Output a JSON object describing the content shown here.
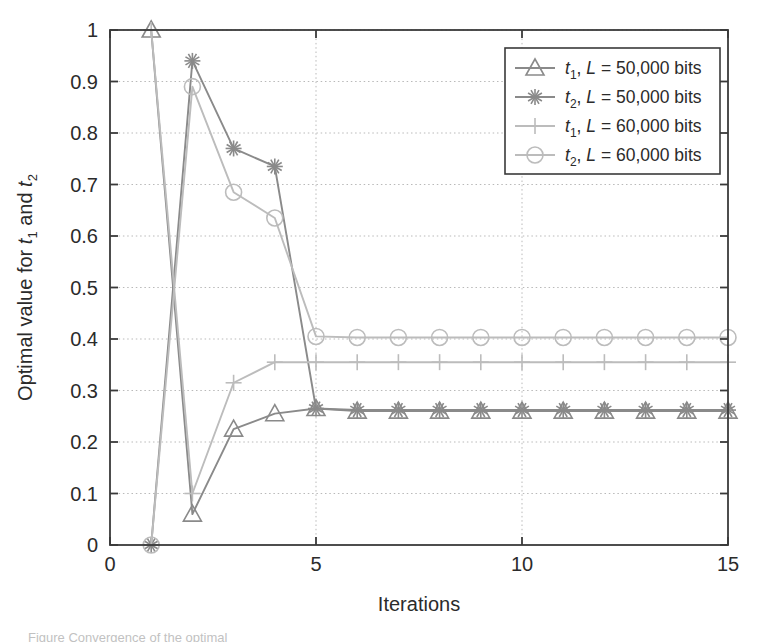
{
  "figure": {
    "caption_partial": "Figure  Convergence of the optimal",
    "background_color": "#ffffff"
  },
  "chart_data": {
    "type": "line",
    "title": "",
    "xlabel": "Iterations",
    "ylabel": "Optimal value for t1 and t2",
    "ylabel_rich": {
      "prefix": "Optimal value for ",
      "var1": "t",
      "var1_sub": "1",
      "middle": " and ",
      "var2": "t",
      "var2_sub": "2"
    },
    "xlim": [
      0,
      15
    ],
    "ylim": [
      0,
      1
    ],
    "xticks": [
      0,
      5,
      10,
      15
    ],
    "xtick_labels": [
      "0",
      "5",
      "10",
      "15"
    ],
    "yticks": [
      0,
      0.1,
      0.2,
      0.3,
      0.4,
      0.5,
      0.6,
      0.7,
      0.8,
      0.9,
      1
    ],
    "ytick_labels": [
      "0",
      "0.1",
      "0.2",
      "0.3",
      "0.4",
      "0.5",
      "0.6",
      "0.7",
      "0.8",
      "0.9",
      "1"
    ],
    "grid": true,
    "grid_style": "dotted",
    "grid_color": "#b9b9b9",
    "axis_color": "#3a3a3a",
    "legend_position": "top-right",
    "x": [
      1,
      2,
      3,
      4,
      5,
      6,
      7,
      8,
      9,
      10,
      11,
      12,
      13,
      14,
      15
    ],
    "series": [
      {
        "name": "t1, L = 50,000 bits",
        "label_parts": {
          "var": "t",
          "sub": "1",
          "rest": ", ",
          "italic_L": "L",
          "tail": " = 50,000 bits"
        },
        "marker": "triangle",
        "color": "#8a8a8a",
        "values": [
          1,
          0.06,
          0.225,
          0.255,
          0.265,
          0.26,
          0.26,
          0.26,
          0.26,
          0.26,
          0.26,
          0.26,
          0.26,
          0.26,
          0.26
        ]
      },
      {
        "name": "t2, L = 50,000 bits",
        "label_parts": {
          "var": "t",
          "sub": "2",
          "rest": ", ",
          "italic_L": "L",
          "tail": " = 50,000 bits"
        },
        "marker": "star",
        "color": "#8a8a8a",
        "values": [
          0,
          0.94,
          0.77,
          0.735,
          0.265,
          0.262,
          0.262,
          0.262,
          0.262,
          0.262,
          0.262,
          0.262,
          0.262,
          0.262,
          0.262
        ]
      },
      {
        "name": "t1, L = 60,000 bits",
        "label_parts": {
          "var": "t",
          "sub": "1",
          "rest": ", ",
          "italic_L": "L",
          "tail": " = 60,000 bits"
        },
        "marker": "plus",
        "color": "#bcbcbc",
        "values": [
          1,
          0.1,
          0.315,
          0.355,
          0.355,
          0.355,
          0.355,
          0.355,
          0.355,
          0.355,
          0.355,
          0.355,
          0.355,
          0.355,
          0.355
        ]
      },
      {
        "name": "t2, L = 60,000 bits",
        "label_parts": {
          "var": "t",
          "sub": "2",
          "rest": ", ",
          "italic_L": "L",
          "tail": " = 60,000 bits"
        },
        "marker": "circle",
        "color": "#bcbcbc",
        "values": [
          0,
          0.89,
          0.685,
          0.635,
          0.405,
          0.403,
          0.403,
          0.403,
          0.403,
          0.403,
          0.403,
          0.403,
          0.403,
          0.403,
          0.403
        ]
      }
    ]
  }
}
